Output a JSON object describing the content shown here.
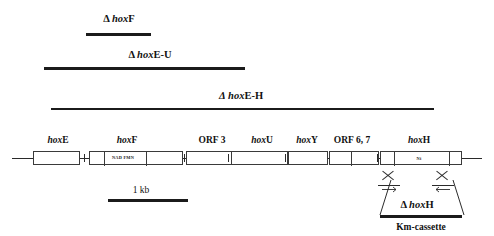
{
  "figure": {
    "type": "gene-cluster-map",
    "caption_elements": {
      "scale_bar_label": "1 kb",
      "km_cassette_label": "Km-cassette",
      "hoxh_deletion_label_delta": "Δ",
      "hoxh_deletion_label_gene": "hox",
      "hoxh_deletion_label_suffix": "H"
    }
  },
  "deletion_constructs": [
    {
      "id": "delta-hoxF",
      "delta": "Δ",
      "gene_italic": "hox",
      "gene_suffix": "F",
      "label_full": "Δ hoxF",
      "bar_start_px": 86,
      "bar_end_px": 151,
      "bar_y_px": 33,
      "label_x_px": 119,
      "label_y_px": 14
    },
    {
      "id": "delta-hoxE-U",
      "delta": "Δ",
      "gene_italic": "hox",
      "gene_suffix": "E-U",
      "label_full": "Δ hoxE-U",
      "bar_start_px": 44,
      "bar_end_px": 245,
      "bar_y_px": 67,
      "label_x_px": 150,
      "label_y_px": 50
    },
    {
      "id": "delta-hoxE-H",
      "delta": "Δ",
      "gene_italic": "hox",
      "gene_suffix": "E-H",
      "label_full": "Δ hoxE-H",
      "bar_start_px": 51,
      "bar_end_px": 434,
      "bar_y_px": 108,
      "label_x_px": 241,
      "label_y_px": 91
    }
  ],
  "genes": [
    {
      "id": "hoxE",
      "italic": "hox",
      "suffix": "E",
      "label": "hoxE",
      "label_x_px": 58,
      "box_x_px": 33,
      "box_w_px": 47
    },
    {
      "id": "hoxF",
      "italic": "hox",
      "suffix": "F",
      "label": "hoxF",
      "label_x_px": 127,
      "box_x_px": 89,
      "box_w_px": 94
    },
    {
      "id": "ORF3",
      "italic": "",
      "suffix": "ORF 3",
      "label": "ORF 3",
      "label_x_px": 212,
      "box_x_px": 186,
      "box_w_px": 57
    },
    {
      "id": "hoxU",
      "italic": "hox",
      "suffix": "U",
      "label": "hoxU",
      "label_x_px": 262,
      "box_x_px": 231,
      "box_w_px": 57
    },
    {
      "id": "hoxY",
      "italic": "hox",
      "suffix": "Y",
      "label": "hoxY",
      "label_x_px": 307,
      "box_x_px": 288,
      "box_w_px": 40
    },
    {
      "id": "ORF67",
      "italic": "",
      "suffix": "ORF 6, 7",
      "label": "ORF 6, 7",
      "label_x_px": 352,
      "box_x_px": 329,
      "box_w_px": 50
    },
    {
      "id": "hoxH",
      "italic": "hox",
      "suffix": "H",
      "label": "hoxH",
      "label_x_px": 419,
      "box_x_px": 380,
      "box_w_px": 82
    }
  ],
  "domain_annotations": [
    {
      "id": "nad-fmn",
      "text": "NAD  FMN",
      "x_px": 123,
      "y_px": 153,
      "parent_gene": "hoxF"
    },
    {
      "id": "ni-site",
      "text": "Ni",
      "x_px": 419,
      "y_px": 154,
      "parent_gene": "hoxH"
    }
  ],
  "backbone": {
    "start_px": 12,
    "end_px": 482,
    "y_px": 158
  },
  "scale": {
    "label": "1 kb",
    "label_x_px": 141,
    "label_y_px": 185,
    "bar_start_px": 108,
    "bar_end_px": 188,
    "bar_y_px": 199
  },
  "recombination": {
    "crossover_marks": [
      {
        "id": "crossover-left",
        "x_px": 388,
        "y_px": 168
      },
      {
        "id": "crossover-right",
        "x_px": 442,
        "y_px": 168
      }
    ],
    "delta_label": "Δ hoxH",
    "delta_label_x_px": 417,
    "delta_label_y_px": 202,
    "km_bar_start_px": 380,
    "km_bar_end_px": 462,
    "km_bar_y_px": 215,
    "km_label": "Km-cassette",
    "km_label_x_px": 421,
    "km_label_y_px": 222
  },
  "colors": {
    "ink": "#1b1b1b",
    "line": "#2a2a2a",
    "box_stroke": "#3a3a3a",
    "background": "#ffffff"
  }
}
